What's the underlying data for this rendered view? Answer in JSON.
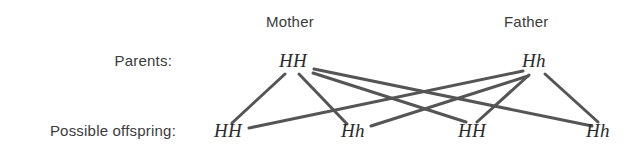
{
  "diagram": {
    "background_color": "#ffffff",
    "line_color": "#555555",
    "text_color": "#3b3b3b",
    "genotype_color": "#2b2b2b"
  },
  "headers": {
    "mother": "Mother",
    "father": "Father"
  },
  "row_labels": {
    "parents": "Parents:",
    "offspring": "Possible offspring:"
  },
  "parents": [
    {
      "id": "mother",
      "genotype": "HH",
      "x": 295,
      "y": 68
    },
    {
      "id": "father",
      "genotype": "Hh",
      "x": 536,
      "y": 68
    }
  ],
  "offspring": [
    {
      "id": "offspring-1",
      "genotype": "HH",
      "x": 230,
      "y": 131
    },
    {
      "id": "offspring-2",
      "genotype": "Hh",
      "x": 355,
      "y": 131
    },
    {
      "id": "offspring-3",
      "genotype": "HH",
      "x": 473,
      "y": 131
    },
    {
      "id": "offspring-4",
      "genotype": "Hh",
      "x": 600,
      "y": 131
    }
  ],
  "links": [
    {
      "from": "mother",
      "to": "offspring-1",
      "x1": 285,
      "y1": 74,
      "x2": 232,
      "y2": 123
    },
    {
      "from": "mother",
      "to": "offspring-2",
      "x1": 299,
      "y1": 74,
      "x2": 347,
      "y2": 124
    },
    {
      "from": "mother",
      "to": "offspring-3",
      "x1": 313,
      "y1": 73,
      "x2": 466,
      "y2": 122
    },
    {
      "from": "mother",
      "to": "offspring-4",
      "x1": 314,
      "y1": 69,
      "x2": 592,
      "y2": 126
    },
    {
      "from": "father",
      "to": "offspring-1",
      "x1": 523,
      "y1": 71,
      "x2": 249,
      "y2": 128
    },
    {
      "from": "father",
      "to": "offspring-2",
      "x1": 528,
      "y1": 76,
      "x2": 371,
      "y2": 126
    },
    {
      "from": "father",
      "to": "offspring-3",
      "x1": 529,
      "y1": 75,
      "x2": 477,
      "y2": 122
    },
    {
      "from": "father",
      "to": "offspring-4",
      "x1": 545,
      "y1": 74,
      "x2": 598,
      "y2": 122
    }
  ],
  "chart_data": {
    "type": "diagram",
    "nodes": {
      "parents": [
        {
          "label": "Mother",
          "genotype": "HH"
        },
        {
          "label": "Father",
          "genotype": "Hh"
        }
      ],
      "offspring": [
        "HH",
        "Hh",
        "HH",
        "Hh"
      ]
    },
    "edges": [
      [
        "Mother HH",
        "offspring 1 HH"
      ],
      [
        "Mother HH",
        "offspring 2 Hh"
      ],
      [
        "Mother HH",
        "offspring 3 HH"
      ],
      [
        "Mother HH",
        "offspring 4 Hh"
      ],
      [
        "Father Hh",
        "offspring 1 HH"
      ],
      [
        "Father Hh",
        "offspring 2 Hh"
      ],
      [
        "Father Hh",
        "offspring 3 HH"
      ],
      [
        "Father Hh",
        "offspring 4 Hh"
      ]
    ],
    "row_labels": [
      "Parents:",
      "Possible offspring:"
    ],
    "column_labels": [
      "Mother",
      "Father"
    ]
  }
}
